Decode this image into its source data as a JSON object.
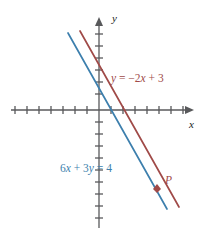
{
  "figure": {
    "type": "coordinate-plane-graph",
    "background_color": "#ffffff",
    "axes": {
      "x_label": "x",
      "y_label": "y",
      "axis_color": "#58595b",
      "origin_px": [
        99,
        110
      ],
      "tick_spacing_px": 12,
      "x_ticks_left": 8,
      "x_ticks_right": 7,
      "y_ticks_up": 7,
      "y_ticks_down": 9,
      "tick_half_len_px": 4,
      "show_tick_numbers": false
    },
    "lines": [
      {
        "name": "red-line",
        "label": "y = −2x + 3",
        "label_parts": {
          "y": "y",
          "eq": " = ",
          "coef": "−2",
          "x": "x",
          "plus": " + 3"
        },
        "color": "#a04a48",
        "slope": -2,
        "y_intercept": 3,
        "label_pos_px": [
          111,
          82
        ],
        "start_px": [
          80,
          31
        ],
        "end_px": [
          179,
          207
        ]
      },
      {
        "name": "blue-line",
        "label": "6x + 3y = 4",
        "label_parts": {
          "c1": "6",
          "x": "x",
          "plus": " + ",
          "c2": "3",
          "y": "y",
          "eq": " = 4"
        },
        "color": "#3d7fad",
        "slope": -2,
        "y_intercept": 1.3333,
        "label_pos_px": [
          60,
          172
        ],
        "start_px": [
          68,
          33
        ],
        "end_px": [
          167,
          209
        ]
      }
    ],
    "point_marker": {
      "name": "point-p",
      "label": "P",
      "color": "#a04a48",
      "marker_px": [
        157,
        188
      ],
      "label_px": [
        165,
        184
      ]
    }
  }
}
